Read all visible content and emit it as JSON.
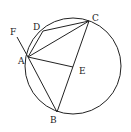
{
  "diagram": {
    "type": "circle-geometry",
    "circle": {
      "cx": 73,
      "cy": 66,
      "r": 48
    },
    "points": {
      "A": {
        "x": 28,
        "y": 57,
        "label": "A",
        "lx": 18,
        "ly": 64
      },
      "B": {
        "x": 57,
        "y": 112,
        "label": "B",
        "lx": 50,
        "ly": 123
      },
      "C": {
        "x": 89,
        "y": 21,
        "label": "C",
        "lx": 92,
        "ly": 21
      },
      "D": {
        "x": 43,
        "y": 31,
        "label": "D",
        "lx": 33,
        "ly": 30
      },
      "E": {
        "x": 73,
        "y": 67,
        "label": "E",
        "lx": 79,
        "ly": 74
      },
      "F": {
        "x": 17,
        "y": 37,
        "label": "F",
        "lx": 10,
        "ly": 35
      }
    },
    "segments": [
      [
        "F",
        "A"
      ],
      [
        "A",
        "D"
      ],
      [
        "D",
        "C"
      ],
      [
        "A",
        "C"
      ],
      [
        "A",
        "E"
      ],
      [
        "A",
        "B"
      ],
      [
        "B",
        "C"
      ]
    ]
  }
}
